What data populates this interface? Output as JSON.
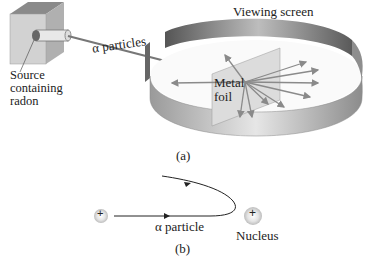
{
  "panel_a": {
    "caption": "(a)",
    "labels": {
      "source": [
        "Source",
        "containing",
        "radon"
      ],
      "alpha_particles": "α particles",
      "viewing_screen": "Viewing screen",
      "metal_foil": [
        "Metal",
        "foil"
      ]
    }
  },
  "panel_b": {
    "caption": "(b)",
    "labels": {
      "alpha_particle": "α particle",
      "nucleus": "Nucleus",
      "alpha_charge": "+",
      "nucleus_charge": "+"
    }
  },
  "colors": {
    "box_front": "#cfcfcf",
    "box_top": "#8a8a8a",
    "box_side": "#b5b5b5",
    "screen_outer": "#c8c8c8",
    "screen_inner_dark": "#6e6e6e",
    "foil": "#d9d9d9",
    "ray": "#8a8a8a"
  }
}
